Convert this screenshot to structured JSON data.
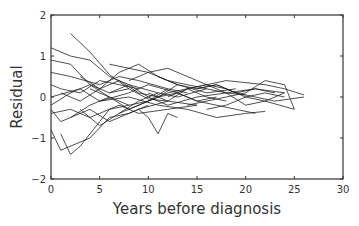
{
  "chart_data": {
    "type": "line",
    "title": "",
    "xlabel": "Years before diagnosis",
    "ylabel": "Residual",
    "xlim": [
      0,
      30
    ],
    "ylim": [
      -2,
      2
    ],
    "xticks": [
      0,
      5,
      10,
      15,
      20,
      25,
      30
    ],
    "yticks": [
      2,
      1,
      0,
      -1,
      -2
    ],
    "grid": false,
    "legend": null,
    "line_color": "#222222",
    "series": [
      {
        "name": "s1",
        "x": [
          2,
          4,
          6,
          8,
          10,
          12
        ],
        "y": [
          1.55,
          1.1,
          0.55,
          0.2,
          -0.05,
          -0.1
        ]
      },
      {
        "name": "s2",
        "x": [
          0,
          2,
          4,
          6,
          8,
          11
        ],
        "y": [
          1.2,
          1.0,
          0.9,
          0.5,
          0.3,
          0.1
        ]
      },
      {
        "name": "s3",
        "x": [
          0,
          1,
          3,
          5,
          7,
          9
        ],
        "y": [
          0.3,
          0.2,
          0.1,
          0.4,
          0.3,
          0.2
        ]
      },
      {
        "name": "s4",
        "x": [
          1,
          2,
          3,
          5,
          6,
          8
        ],
        "y": [
          -0.9,
          -1.4,
          -1.2,
          -0.6,
          -0.3,
          -0.2
        ]
      },
      {
        "name": "s5",
        "x": [
          0,
          2,
          4,
          7,
          9,
          12,
          15
        ],
        "y": [
          -0.4,
          -0.3,
          -0.5,
          -0.2,
          -0.4,
          -0.3,
          -0.2
        ]
      },
      {
        "name": "s6",
        "x": [
          0,
          2,
          5,
          7,
          9,
          12,
          14
        ],
        "y": [
          0.6,
          0.5,
          0.3,
          0.5,
          0.4,
          0.2,
          0.1
        ]
      },
      {
        "name": "s7",
        "x": [
          0,
          3,
          5,
          8,
          10,
          13,
          15,
          17
        ],
        "y": [
          0.0,
          0.2,
          -0.1,
          0.1,
          0.3,
          0.1,
          -0.1,
          0.0
        ]
      },
      {
        "name": "s8",
        "x": [
          0,
          1,
          4,
          6,
          8,
          10
        ],
        "y": [
          -0.8,
          -1.3,
          -1.0,
          -0.5,
          -0.4,
          -0.2
        ]
      },
      {
        "name": "s9",
        "x": [
          3,
          5,
          7,
          9,
          11,
          13,
          16
        ],
        "y": [
          -0.3,
          -0.7,
          -0.4,
          -0.1,
          0.1,
          0.0,
          0.2
        ]
      },
      {
        "name": "s10",
        "x": [
          9,
          10,
          11,
          12,
          13
        ],
        "y": [
          -0.3,
          -0.5,
          -0.9,
          -0.4,
          -0.5
        ]
      },
      {
        "name": "s11",
        "x": [
          6,
          8,
          10,
          12,
          14,
          16,
          18,
          20
        ],
        "y": [
          0.8,
          0.7,
          0.6,
          0.4,
          0.3,
          0.2,
          0.1,
          0.05
        ]
      },
      {
        "name": "s12",
        "x": [
          8,
          10,
          12,
          14,
          16,
          18,
          20,
          22,
          24
        ],
        "y": [
          0.4,
          0.6,
          0.7,
          0.5,
          0.3,
          0.2,
          0.0,
          0.1,
          0.0
        ]
      },
      {
        "name": "s13",
        "x": [
          10,
          12,
          14,
          16,
          18,
          20,
          22,
          25
        ],
        "y": [
          0.1,
          -0.1,
          0.2,
          0.3,
          0.1,
          -0.2,
          -0.1,
          -0.3
        ]
      },
      {
        "name": "s14",
        "x": [
          12,
          14,
          16,
          18,
          20,
          22,
          24,
          26
        ],
        "y": [
          0.0,
          0.2,
          0.3,
          0.4,
          0.35,
          0.3,
          0.2,
          0.05
        ]
      },
      {
        "name": "s15",
        "x": [
          14,
          16,
          18,
          20,
          22,
          24,
          25
        ],
        "y": [
          -0.2,
          -0.1,
          0.0,
          0.1,
          0.4,
          0.3,
          -0.3
        ]
      },
      {
        "name": "s16",
        "x": [
          15,
          17,
          19,
          21,
          23,
          26
        ],
        "y": [
          0.2,
          0.3,
          0.1,
          0.0,
          -0.1,
          0.0
        ]
      },
      {
        "name": "s17",
        "x": [
          5,
          8,
          11,
          14,
          17,
          20,
          22
        ],
        "y": [
          -0.1,
          0.0,
          -0.2,
          -0.3,
          -0.5,
          -0.4,
          -0.35
        ]
      },
      {
        "name": "s18",
        "x": [
          0,
          2,
          4,
          6,
          8
        ],
        "y": [
          0.9,
          0.8,
          0.3,
          0.1,
          0.2
        ]
      },
      {
        "name": "s19",
        "x": [
          1,
          3,
          5,
          7,
          9,
          11,
          13
        ],
        "y": [
          0.1,
          -0.1,
          0.2,
          0.6,
          0.8,
          0.5,
          0.3
        ]
      },
      {
        "name": "s20",
        "x": [
          4,
          6,
          8,
          10,
          12,
          14,
          16,
          18
        ],
        "y": [
          0.2,
          0.0,
          -0.2,
          -0.1,
          0.1,
          0.2,
          0.0,
          -0.1
        ]
      },
      {
        "name": "s21",
        "x": [
          7,
          9,
          11,
          13,
          15,
          17,
          19,
          21
        ],
        "y": [
          -0.4,
          -0.2,
          0.0,
          0.1,
          -0.1,
          -0.2,
          -0.3,
          -0.4
        ]
      },
      {
        "name": "s22",
        "x": [
          11,
          13,
          15,
          17,
          19,
          21,
          23
        ],
        "y": [
          0.5,
          0.3,
          0.2,
          0.3,
          0.1,
          0.2,
          0.1
        ]
      },
      {
        "name": "s23",
        "x": [
          0,
          2,
          4,
          6,
          8,
          10,
          12
        ],
        "y": [
          -0.2,
          0.1,
          0.3,
          0.0,
          -0.3,
          -0.1,
          0.2
        ]
      },
      {
        "name": "s24",
        "x": [
          3,
          5,
          7,
          9,
          11,
          13,
          16,
          19
        ],
        "y": [
          0.5,
          0.2,
          0.4,
          0.1,
          0.0,
          0.3,
          0.1,
          0.2
        ]
      },
      {
        "name": "s25",
        "x": [
          16,
          18,
          20,
          22,
          24
        ],
        "y": [
          -0.3,
          -0.2,
          0.0,
          -0.1,
          0.1
        ]
      },
      {
        "name": "s26",
        "x": [
          2,
          4,
          6,
          9,
          12,
          15
        ],
        "y": [
          -0.5,
          -0.3,
          -0.6,
          -0.3,
          -0.1,
          -0.2
        ]
      },
      {
        "name": "s27",
        "x": [
          6,
          8,
          10,
          12,
          15,
          18,
          21,
          24
        ],
        "y": [
          0.1,
          0.3,
          0.0,
          -0.2,
          0.0,
          0.1,
          0.2,
          0.1
        ]
      },
      {
        "name": "s28",
        "x": [
          0,
          1,
          2,
          4,
          6
        ],
        "y": [
          -0.3,
          -0.6,
          -0.5,
          -0.2,
          0.0
        ]
      }
    ]
  }
}
